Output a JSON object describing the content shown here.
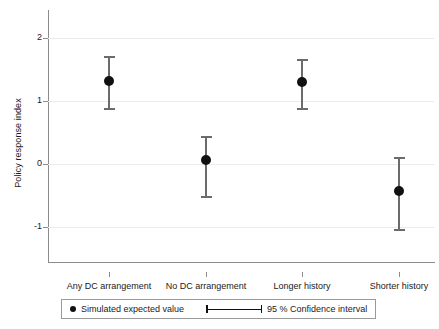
{
  "chart_data": {
    "type": "scatter",
    "title": "",
    "xlabel": "",
    "ylabel": "Policy response index",
    "ylim": [
      -1.55,
      2.45
    ],
    "yticks": [
      -1,
      0,
      1,
      2
    ],
    "ytick_labels": [
      "-1",
      "0",
      "1",
      "2"
    ],
    "grid": true,
    "categories": [
      "Any DC arrangement",
      "No DC arrangement",
      "Longer history",
      "Shorter history"
    ],
    "values": [
      1.33,
      0.07,
      1.3,
      -0.42
    ],
    "ci_low": [
      0.87,
      -0.53,
      0.87,
      -1.05
    ],
    "ci_high": [
      1.72,
      0.45,
      1.67,
      0.12
    ],
    "ci_level": "95 %",
    "legend": {
      "position": "bottom",
      "entries": [
        {
          "label": "Simulated expected value",
          "marker": "filled-circle"
        },
        {
          "label": "95 % Confidence interval",
          "marker": "capped-line"
        }
      ]
    },
    "colors": {
      "marker": "#111111",
      "whisker": "#6b6b6b",
      "axis": "#8c8c8c",
      "grid": "#ebebeb",
      "background": "#ffffff"
    }
  }
}
